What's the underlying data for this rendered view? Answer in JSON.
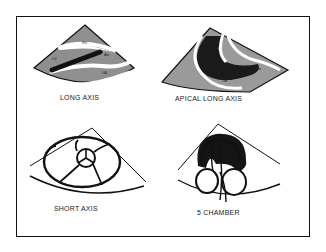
{
  "figure": {
    "panels": [
      {
        "id": "long-axis",
        "label": "LONG AXIS",
        "chambers": [
          "RV",
          "LV",
          "Ao",
          "LA"
        ]
      },
      {
        "id": "apical-long-axis",
        "label": "APICAL LONG AXIS",
        "chambers": [
          "LV",
          "LA",
          "Ao"
        ]
      },
      {
        "id": "short-axis",
        "label": "SHORT AXIS",
        "chambers": []
      },
      {
        "id": "five-chamber",
        "label": "5 CHAMBER",
        "chambers": []
      }
    ],
    "colors": {
      "line": "#111111",
      "tissue": "#9a9a9a",
      "dark": "#1a1a1a",
      "background": "#ffffff"
    }
  }
}
